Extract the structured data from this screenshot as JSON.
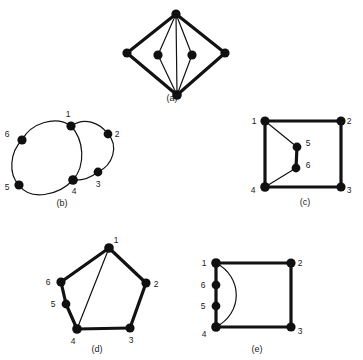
{
  "figure": {
    "background_color": "#ffffff",
    "ink_color": "#121212",
    "subfigures": [
      {
        "id": "a",
        "caption": "(a)",
        "caption_pos": [
          172,
          101
        ],
        "description": "Diamond-shaped graph with two interior vertices joined to the top and bottom apex vertices",
        "vertices": [
          {
            "name": "top-apex",
            "label": "",
            "x": 176,
            "y": 14,
            "r": 4.6
          },
          {
            "name": "left-apex",
            "label": "",
            "x": 127,
            "y": 53,
            "r": 4.6
          },
          {
            "name": "right-apex",
            "label": "",
            "x": 225,
            "y": 53,
            "r": 4.6
          },
          {
            "name": "inner-left",
            "label": "",
            "x": 158,
            "y": 55,
            "r": 4.6
          },
          {
            "name": "inner-right",
            "label": "",
            "x": 192,
            "y": 55,
            "r": 4.6
          },
          {
            "name": "bottom-apex",
            "label": "",
            "x": 177,
            "y": 95,
            "r": 4.8
          }
        ],
        "edges": [
          {
            "from": "top-apex",
            "to": "left-apex",
            "weight": "thick"
          },
          {
            "from": "top-apex",
            "to": "right-apex",
            "weight": "thick"
          },
          {
            "from": "left-apex",
            "to": "bottom-apex",
            "weight": "thick"
          },
          {
            "from": "right-apex",
            "to": "bottom-apex",
            "weight": "thick"
          },
          {
            "from": "top-apex",
            "to": "inner-left",
            "weight": "thin"
          },
          {
            "from": "top-apex",
            "to": "inner-right",
            "weight": "thin"
          },
          {
            "from": "inner-left",
            "to": "bottom-apex",
            "weight": "thin"
          },
          {
            "from": "inner-right",
            "to": "bottom-apex",
            "weight": "thin"
          },
          {
            "from": "top-apex",
            "to": "bottom-apex",
            "weight": "thin"
          }
        ]
      },
      {
        "id": "b",
        "caption": "(b)",
        "caption_pos": [
          62,
          206
        ],
        "description": "Figure-eight style curved graph with six labelled vertices",
        "vertices": [
          {
            "name": "v1",
            "label": "1",
            "x": 71,
            "y": 126,
            "r": 4.6,
            "lx": 68,
            "ly": 117
          },
          {
            "name": "v2",
            "label": "2",
            "x": 108,
            "y": 134,
            "r": 4.4,
            "lx": 117,
            "ly": 137
          },
          {
            "name": "v3",
            "label": "3",
            "x": 98,
            "y": 172,
            "r": 4.4,
            "lx": 98,
            "ly": 187
          },
          {
            "name": "v4",
            "label": "4",
            "x": 73,
            "y": 180,
            "r": 4.8,
            "lx": 74,
            "ly": 194
          },
          {
            "name": "v5",
            "label": "5",
            "x": 19,
            "y": 185,
            "r": 4.6,
            "lx": 7,
            "ly": 190
          },
          {
            "name": "v6",
            "label": "6",
            "x": 22,
            "y": 140,
            "r": 4.6,
            "lx": 7,
            "ly": 137
          }
        ],
        "edges": [
          {
            "from": "v1",
            "to": "v2",
            "weight": "thin",
            "curve": "arc-up"
          },
          {
            "from": "v2",
            "to": "v3",
            "weight": "thin",
            "curve": "arc-right"
          },
          {
            "from": "v3",
            "to": "v4",
            "weight": "thin",
            "curve": "arc-down"
          },
          {
            "from": "v4",
            "to": "v1",
            "weight": "thin",
            "curve": "arc-right"
          },
          {
            "from": "v1",
            "to": "v6",
            "weight": "thin",
            "curve": "arc-up"
          },
          {
            "from": "v6",
            "to": "v5",
            "weight": "thin",
            "curve": "arc-left"
          },
          {
            "from": "v5",
            "to": "v4",
            "weight": "thin",
            "curve": "arc-down"
          }
        ]
      },
      {
        "id": "c",
        "caption": "(c)",
        "caption_pos": [
          305,
          205
        ],
        "description": "Square with vertices 1,2,3,4 at the corners and an interior path 1-5-6-4",
        "vertices": [
          {
            "name": "v1",
            "label": "1",
            "x": 265,
            "y": 121,
            "r": 4.6,
            "lx": 254,
            "ly": 124
          },
          {
            "name": "v2",
            "label": "2",
            "x": 341,
            "y": 121,
            "r": 4.6,
            "lx": 349,
            "ly": 124
          },
          {
            "name": "v3",
            "label": "3",
            "x": 341,
            "y": 187,
            "r": 4.6,
            "lx": 349,
            "ly": 193
          },
          {
            "name": "v4",
            "label": "4",
            "x": 265,
            "y": 187,
            "r": 4.8,
            "lx": 253,
            "ly": 193
          },
          {
            "name": "v5",
            "label": "5",
            "x": 297,
            "y": 147,
            "r": 4.4,
            "lx": 306,
            "ly": 146
          },
          {
            "name": "v6",
            "label": "6",
            "x": 296,
            "y": 168,
            "r": 4.4,
            "lx": 306,
            "ly": 167
          }
        ],
        "edges": [
          {
            "from": "v1",
            "to": "v2",
            "weight": "thick"
          },
          {
            "from": "v2",
            "to": "v3",
            "weight": "thick"
          },
          {
            "from": "v3",
            "to": "v4",
            "weight": "thick"
          },
          {
            "from": "v4",
            "to": "v1",
            "weight": "thick"
          },
          {
            "from": "v1",
            "to": "v5",
            "weight": "thin"
          },
          {
            "from": "v5",
            "to": "v6",
            "weight": "thick"
          },
          {
            "from": "v6",
            "to": "v4",
            "weight": "thin"
          }
        ]
      },
      {
        "id": "d",
        "caption": "(d)",
        "caption_pos": [
          97,
          351
        ],
        "description": "Hexagonal cycle 1-2-3-4-5-6 with a thin chord from vertex 1 to vertex 4",
        "vertices": [
          {
            "name": "v1",
            "label": "1",
            "x": 109,
            "y": 248,
            "r": 4.8,
            "lx": 114,
            "ly": 241
          },
          {
            "name": "v2",
            "label": "2",
            "x": 146,
            "y": 283,
            "r": 4.6,
            "lx": 154,
            "ly": 286
          },
          {
            "name": "v3",
            "label": "3",
            "x": 130,
            "y": 328,
            "r": 4.6,
            "lx": 130,
            "ly": 343
          },
          {
            "name": "v4",
            "label": "4",
            "x": 77,
            "y": 329,
            "r": 4.8,
            "lx": 73,
            "ly": 344
          },
          {
            "name": "v5",
            "label": "5",
            "x": 66,
            "y": 304,
            "r": 4.4,
            "lx": 54,
            "ly": 306
          },
          {
            "name": "v6",
            "label": "6",
            "x": 61,
            "y": 282,
            "r": 4.6,
            "lx": 49,
            "ly": 285
          }
        ],
        "edges": [
          {
            "from": "v1",
            "to": "v2",
            "weight": "thick"
          },
          {
            "from": "v2",
            "to": "v3",
            "weight": "thick"
          },
          {
            "from": "v3",
            "to": "v4",
            "weight": "thick"
          },
          {
            "from": "v4",
            "to": "v5",
            "weight": "thick"
          },
          {
            "from": "v5",
            "to": "v6",
            "weight": "thick"
          },
          {
            "from": "v6",
            "to": "v1",
            "weight": "thick"
          },
          {
            "from": "v1",
            "to": "v4",
            "weight": "thin"
          }
        ]
      },
      {
        "id": "e",
        "caption": "(e)",
        "caption_pos": [
          257,
          351
        ],
        "description": "Square 1-2-3-4 with vertices 6 and 5 subdividing the left side, plus a curved arc from 1 to 4",
        "vertices": [
          {
            "name": "v1",
            "label": "1",
            "x": 216,
            "y": 263,
            "r": 4.8,
            "lx": 204,
            "ly": 265
          },
          {
            "name": "v2",
            "label": "2",
            "x": 291,
            "y": 263,
            "r": 4.6,
            "lx": 299,
            "ly": 265
          },
          {
            "name": "v3",
            "label": "3",
            "x": 291,
            "y": 327,
            "r": 4.6,
            "lx": 299,
            "ly": 333
          },
          {
            "name": "v4",
            "label": "4",
            "x": 216,
            "y": 327,
            "r": 4.8,
            "lx": 204,
            "ly": 336
          },
          {
            "name": "v5",
            "label": "5",
            "x": 216,
            "y": 306,
            "r": 4.4,
            "lx": 203,
            "ly": 309
          },
          {
            "name": "v6",
            "label": "6",
            "x": 216,
            "y": 285,
            "r": 4.4,
            "lx": 203,
            "ly": 288
          }
        ],
        "edges": [
          {
            "from": "v1",
            "to": "v2",
            "weight": "thick"
          },
          {
            "from": "v2",
            "to": "v3",
            "weight": "thick"
          },
          {
            "from": "v3",
            "to": "v4",
            "weight": "thick"
          },
          {
            "from": "v1",
            "to": "v6",
            "weight": "thick"
          },
          {
            "from": "v6",
            "to": "v5",
            "weight": "thick"
          },
          {
            "from": "v5",
            "to": "v4",
            "weight": "thick"
          },
          {
            "from": "v1",
            "to": "v4",
            "weight": "thin",
            "curve": "arc-right"
          }
        ]
      }
    ]
  }
}
